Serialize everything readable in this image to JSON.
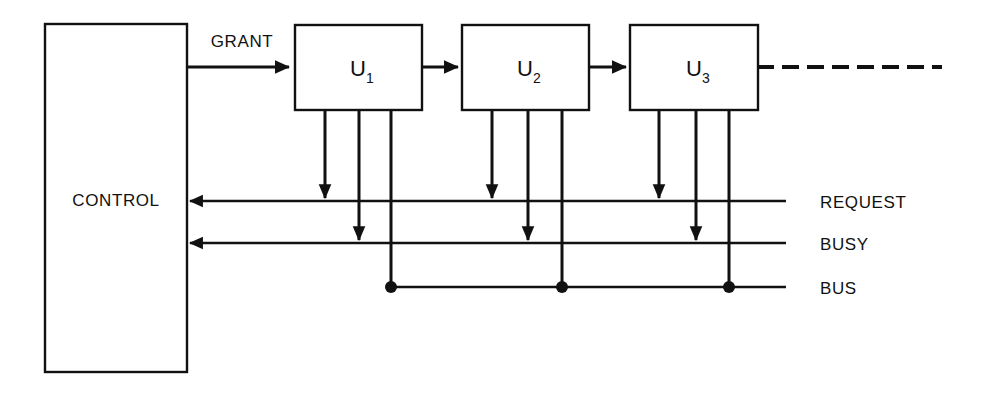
{
  "diagram": {
    "background_color": "#ffffff",
    "line_color": "#111111",
    "control": {
      "label": "CONTROL"
    },
    "grant": {
      "label": "GRANT"
    },
    "units": [
      {
        "base": "U",
        "subscript": "1"
      },
      {
        "base": "U",
        "subscript": "2"
      },
      {
        "base": "U",
        "subscript": "3"
      }
    ],
    "signal_lines": [
      {
        "label": "REQUEST"
      },
      {
        "label": "BUSY"
      },
      {
        "label": "BUS"
      }
    ],
    "continuation": {
      "style": "dashed",
      "meaning": "more units continue"
    }
  }
}
